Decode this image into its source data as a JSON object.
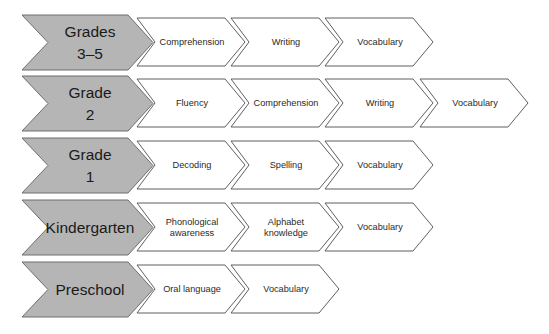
{
  "diagram": {
    "colors": {
      "stage_fill": "#b5b5b5",
      "stage_stroke": "#6f6f6f",
      "skill_fill": "#ffffff",
      "skill_stroke": "#5f5f5f"
    },
    "rows": [
      {
        "stage": [
          "Grades",
          "3–5"
        ],
        "skills": [
          [
            "Comprehension"
          ],
          [
            "Writing"
          ],
          [
            "Vocabulary"
          ]
        ]
      },
      {
        "stage": [
          "Grade",
          "2"
        ],
        "skills": [
          [
            "Fluency"
          ],
          [
            "Comprehension"
          ],
          [
            "Writing"
          ],
          [
            "Vocabulary"
          ]
        ]
      },
      {
        "stage": [
          "Grade",
          "1"
        ],
        "skills": [
          [
            "Decoding"
          ],
          [
            "Spelling"
          ],
          [
            "Vocabulary"
          ]
        ]
      },
      {
        "stage": [
          "Kindergarten"
        ],
        "skills": [
          [
            "Phonological",
            "awareness"
          ],
          [
            "Alphabet",
            "knowledge"
          ],
          [
            "Vocabulary"
          ]
        ]
      },
      {
        "stage": [
          "Preschool"
        ],
        "skills": [
          [
            "Oral language"
          ],
          [
            "Vocabulary"
          ]
        ]
      }
    ]
  }
}
